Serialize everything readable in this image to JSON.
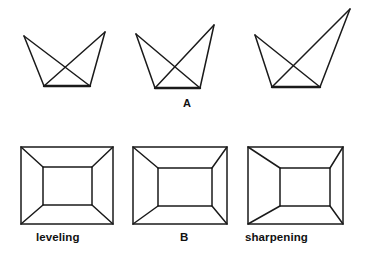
{
  "figure": {
    "background_color": "#ffffff",
    "line_color": "#1a1a1a",
    "width": 375,
    "height": 263
  },
  "rows": [
    {
      "id": "row-a",
      "label": "A",
      "label_position": {
        "x": 183,
        "y": 98
      },
      "shape_type": "crown-bowtie-outline",
      "description": "Three variants of an open crown / bowtie line figure with increasing right-peak height",
      "figures": [
        {
          "id": "row-a-figure-1",
          "name": "leveling-variant",
          "vertices": {
            "top_left": [
              24,
              36
            ],
            "top_right": [
              105,
              32
            ],
            "bottom_left": [
              44,
              86
            ],
            "bottom_right": [
              90,
              86
            ]
          },
          "edges": [
            [
              "top_left",
              "bottom_left"
            ],
            [
              "bottom_left",
              "bottom_right"
            ],
            [
              "bottom_right",
              "top_right"
            ],
            [
              "top_left",
              "bottom_right"
            ],
            [
              "top_right",
              "bottom_left"
            ]
          ]
        },
        {
          "id": "row-a-figure-2",
          "name": "standard-variant",
          "vertices": {
            "top_left": [
              136,
              34
            ],
            "top_right": [
              214,
              25
            ],
            "bottom_left": [
              155,
              88
            ],
            "bottom_right": [
              200,
              88
            ]
          },
          "edges": [
            [
              "top_left",
              "bottom_left"
            ],
            [
              "bottom_left",
              "bottom_right"
            ],
            [
              "bottom_right",
              "top_right"
            ],
            [
              "top_left",
              "bottom_right"
            ],
            [
              "top_right",
              "bottom_left"
            ]
          ]
        },
        {
          "id": "row-a-figure-3",
          "name": "sharpening-variant",
          "vertices": {
            "top_left": [
              255,
              35
            ],
            "top_right": [
              350,
              9
            ],
            "bottom_left": [
              272,
              87
            ],
            "bottom_right": [
              320,
              87
            ]
          },
          "edges": [
            [
              "top_left",
              "bottom_left"
            ],
            [
              "bottom_left",
              "bottom_right"
            ],
            [
              "bottom_right",
              "top_right"
            ],
            [
              "top_left",
              "bottom_right"
            ],
            [
              "top_right",
              "bottom_left"
            ]
          ]
        }
      ]
    },
    {
      "id": "row-b",
      "label": "B",
      "label_position": {
        "x": 180,
        "y": 238
      },
      "shape_type": "nested-rectangle-tunnel",
      "description": "Three variants of a nested rectangle (tunnel) figure with the inner rectangle shifting right",
      "figures": [
        {
          "id": "row-b-figure-1",
          "name": "leveling-tunnel",
          "caption": "leveling",
          "caption_position": {
            "x": 36,
            "y": 238
          },
          "outer": {
            "x1": 21,
            "y1": 147,
            "x2": 113,
            "y2": 224
          },
          "inner": {
            "x1": 43,
            "y1": 167,
            "x2": 92,
            "y2": 205
          }
        },
        {
          "id": "row-b-figure-2",
          "name": "standard-tunnel",
          "caption": "",
          "caption_position": {
            "x": 180,
            "y": 238
          },
          "outer": {
            "x1": 133,
            "y1": 147,
            "x2": 227,
            "y2": 224
          },
          "inner": {
            "x1": 158,
            "y1": 168,
            "x2": 212,
            "y2": 206
          }
        },
        {
          "id": "row-b-figure-3",
          "name": "sharpening-tunnel",
          "caption": "sharpening",
          "caption_position": {
            "x": 245,
            "y": 238
          },
          "outer": {
            "x1": 248,
            "y1": 147,
            "x2": 343,
            "y2": 224
          },
          "inner": {
            "x1": 280,
            "y1": 168,
            "x2": 330,
            "y2": 206
          }
        }
      ]
    }
  ],
  "captions": {
    "row_a_label": "A",
    "row_b_label": "B",
    "leveling": "leveling",
    "sharpening": "sharpening"
  }
}
